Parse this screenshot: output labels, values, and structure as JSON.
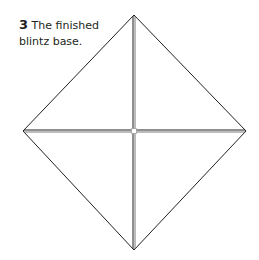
{
  "caption": {
    "step_number": "3",
    "text_line1": "The finished",
    "text_line2": "blintz base."
  },
  "diagram": {
    "name": "blintz-base",
    "stroke_color": "#231f20",
    "corners": {
      "top": [
        134,
        15
      ],
      "right": [
        246,
        131
      ],
      "bottom": [
        134,
        250
      ],
      "left": [
        23,
        131
      ]
    },
    "center": [
      134,
      131
    ]
  }
}
